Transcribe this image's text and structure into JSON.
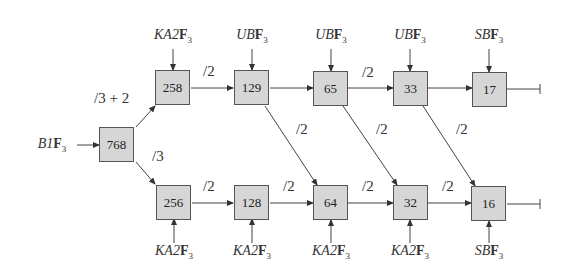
{
  "diagram": {
    "input": {
      "label": "B1F3",
      "text_main": "B1",
      "text_field": "F",
      "text_sub": "3"
    },
    "nodes": [
      {
        "id": "n768",
        "value": "768"
      },
      {
        "id": "n258",
        "value": "258"
      },
      {
        "id": "n129",
        "value": "129"
      },
      {
        "id": "n65",
        "value": "65"
      },
      {
        "id": "n33",
        "value": "33"
      },
      {
        "id": "n17",
        "value": "17"
      },
      {
        "id": "n256",
        "value": "256"
      },
      {
        "id": "n128",
        "value": "128"
      },
      {
        "id": "n64",
        "value": "64"
      },
      {
        "id": "n32",
        "value": "32"
      },
      {
        "id": "n16",
        "value": "16"
      }
    ],
    "top_labels": [
      {
        "main": "KA2",
        "field": "F",
        "sub": "3"
      },
      {
        "main": "UB",
        "field": "F",
        "sub": "3"
      },
      {
        "main": "UB",
        "field": "F",
        "sub": "3"
      },
      {
        "main": "UB",
        "field": "F",
        "sub": "3"
      },
      {
        "main": "SB",
        "field": "F",
        "sub": "3"
      }
    ],
    "bottom_labels": [
      {
        "main": "KA2",
        "field": "F",
        "sub": "3"
      },
      {
        "main": "KA2",
        "field": "F",
        "sub": "3"
      },
      {
        "main": "KA2",
        "field": "F",
        "sub": "3"
      },
      {
        "main": "KA2",
        "field": "F",
        "sub": "3"
      },
      {
        "main": "SB",
        "field": "F",
        "sub": "3"
      }
    ],
    "ops": {
      "upper_branch": "/3 + 2",
      "lower_branch": "/3",
      "top_258_129": "/2",
      "top_65_33": "/2",
      "diag_129_64": "/2",
      "diag_65_32": "/2",
      "diag_33_16": "/2",
      "bot_256_128": "/2",
      "bot_128_64": "/2",
      "bot_64_32": "/2",
      "bot_32_16": "/2"
    },
    "colors": {
      "box_fill": "#d6d6d6",
      "box_border": "#555555",
      "line": "#444444"
    }
  }
}
